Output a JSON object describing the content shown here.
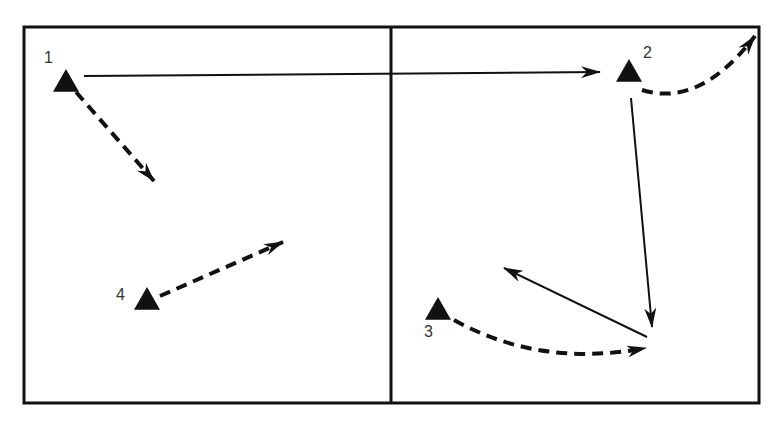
{
  "diagram": {
    "type": "play-diagram",
    "colors": {
      "ink": "#111111",
      "label": "#333333",
      "background": "#ffffff"
    },
    "court": {
      "frame": {
        "x": 24,
        "y": 27,
        "width": 735,
        "height": 376
      },
      "divider_x": 391
    },
    "players": [
      {
        "id": "1",
        "label": "1",
        "x": 66,
        "y": 82,
        "label_x": 44,
        "label_y": 50
      },
      {
        "id": "2",
        "label": "2",
        "x": 629,
        "y": 72,
        "label_x": 643,
        "label_y": 45
      },
      {
        "id": "3",
        "label": "3",
        "x": 438,
        "y": 310,
        "label_x": 424,
        "label_y": 324
      },
      {
        "id": "4",
        "label": "4",
        "x": 147,
        "y": 300,
        "label_x": 116,
        "label_y": 287
      }
    ],
    "paths": [
      {
        "id": "pass-1-to-2",
        "style": "solid",
        "from": "1",
        "d": "M 84 76 L 600 72"
      },
      {
        "id": "run-1",
        "style": "dashed",
        "from": "1",
        "d": "M 76 92 L 154 181"
      },
      {
        "id": "run-2",
        "style": "dashed-curve",
        "from": "2",
        "d": "M 642 90 Q 700 108 755 36"
      },
      {
        "id": "pass-2-down",
        "style": "solid",
        "from": "2",
        "d": "M 631 98 L 652 327"
      },
      {
        "id": "run-3",
        "style": "dashed-curve",
        "from": "3",
        "d": "M 454 320 Q 540 368 646 348"
      },
      {
        "id": "pass-back",
        "style": "solid",
        "from": "ball",
        "d": "M 647 337 L 504 268"
      },
      {
        "id": "run-4",
        "style": "dashed",
        "from": "4",
        "d": "M 160 296 L 283 242"
      }
    ],
    "legend": []
  }
}
